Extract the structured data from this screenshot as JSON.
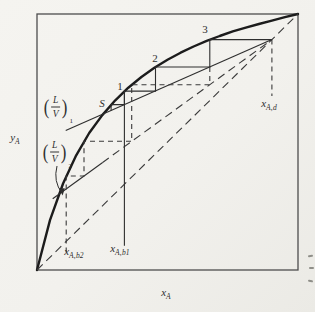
{
  "page": {
    "edge_artifacts": [
      {
        "x": 308,
        "y": 255
      },
      {
        "x": 309,
        "y": 267
      },
      {
        "x": 308,
        "y": 280
      }
    ]
  },
  "figure": {
    "labels": [
      {
        "name": "stage-label-3",
        "kind": "plain",
        "text": "3",
        "x": 205,
        "y": 29
      },
      {
        "name": "stage-label-2",
        "kind": "plain",
        "text": "2",
        "x": 155,
        "y": 58
      },
      {
        "name": "stage-label-1",
        "kind": "plain",
        "text": "1",
        "x": 120,
        "y": 86
      },
      {
        "name": "stage-label-S",
        "kind": "plain",
        "text": "S",
        "x": 102,
        "y": 103,
        "italic": true
      },
      {
        "name": "label-x-Ad",
        "kind": "sub",
        "base": "x",
        "sub": "A,d",
        "x": 269,
        "y": 105
      },
      {
        "name": "label-x-Ab1",
        "kind": "sub",
        "base": "x",
        "sub": "A,b1",
        "x": 120,
        "y": 250
      },
      {
        "name": "label-x-Ab2",
        "kind": "sub",
        "base": "x",
        "sub": "A,b2",
        "x": 74,
        "y": 253
      },
      {
        "name": "axis-label-y",
        "kind": "sub",
        "base": "y",
        "sub": "A",
        "x": 15,
        "y": 139
      },
      {
        "name": "axis-label-x",
        "kind": "sub",
        "base": "x",
        "sub": "A",
        "x": 166,
        "y": 294
      },
      {
        "name": "label-LV1",
        "kind": "fraction",
        "num": "L",
        "den": "V",
        "sub": "1",
        "x": 58,
        "y": 107
      },
      {
        "name": "label-LV2",
        "kind": "fraction",
        "num": "L",
        "den": "V",
        "sub": "2",
        "x": 57,
        "y": 152
      }
    ]
  },
  "chart_data": {
    "type": "line",
    "title": "",
    "xlabel": "x_A",
    "ylabel": "y_A",
    "xlim": [
      0,
      1
    ],
    "ylim": [
      0,
      1
    ],
    "grid": false,
    "description_visible_elements": "equilibrium curve, 45-degree dashed diagonal, operating lines (L/V)1 and (L/V)2 converging at (x_Ad, x_Ad), solid staircase stages S,1,2,3, dashed staircase, composition lines x_Ab2, x_Ab1, x_Ad",
    "key_compositions": {
      "x_Ad": 0.9,
      "x_Ab1": 0.335,
      "x_Ab2": 0.112
    },
    "operating_line_slopes": {
      "LV1": 0.45,
      "LV2": 0.74
    },
    "polylines": [
      {
        "name": "equilibrium-curve",
        "style": "curve",
        "points": [
          [
            0,
            0
          ],
          [
            0.05,
            0.195
          ],
          [
            0.1,
            0.338
          ],
          [
            0.15,
            0.448
          ],
          [
            0.2,
            0.535
          ],
          [
            0.25,
            0.605
          ],
          [
            0.3,
            0.663
          ],
          [
            0.35,
            0.712
          ],
          [
            0.4,
            0.754
          ],
          [
            0.45,
            0.79
          ],
          [
            0.5,
            0.821
          ],
          [
            0.55,
            0.849
          ],
          [
            0.6,
            0.873
          ],
          [
            0.65,
            0.895
          ],
          [
            0.7,
            0.914
          ],
          [
            0.75,
            0.932
          ],
          [
            0.8,
            0.947
          ],
          [
            0.85,
            0.961
          ],
          [
            0.9,
            0.974
          ],
          [
            0.95,
            0.988
          ],
          [
            1,
            1
          ]
        ]
      },
      {
        "name": "diagonal-45",
        "style": "dash-long",
        "points": [
          [
            0,
            0
          ],
          [
            1,
            1
          ]
        ]
      },
      {
        "name": "operating-line-1",
        "style": "thin",
        "points": [
          [
            0.11,
            0.5445
          ],
          [
            0.9,
            0.9
          ]
        ]
      },
      {
        "name": "operating-line-2-solid",
        "style": "thin",
        "points": [
          [
            0.06,
            0.2784
          ],
          [
            0.25,
            0.419
          ]
        ]
      },
      {
        "name": "operating-line-2-dashed",
        "style": "dash-long",
        "points": [
          [
            0.25,
            0.419
          ],
          [
            0.9,
            0.9
          ]
        ]
      },
      {
        "name": "staircase-1-solid",
        "style": "thin",
        "points": [
          [
            0.9,
            0.9
          ],
          [
            0.662,
            0.9
          ],
          [
            0.662,
            0.793
          ],
          [
            0.454,
            0.793
          ],
          [
            0.454,
            0.699
          ],
          [
            0.335,
            0.699
          ],
          [
            0.335,
            0.646
          ],
          [
            0.284,
            0.646
          ],
          [
            0.284,
            0.623
          ]
        ]
      },
      {
        "name": "xab1-drop-line",
        "style": "thin",
        "points": [
          [
            0.335,
            0.699
          ],
          [
            0.335,
            0.095
          ]
        ]
      },
      {
        "name": "staircase-2-dashed",
        "style": "dash-short",
        "points": [
          [
            0.662,
            0.793
          ],
          [
            0.662,
            0.724
          ],
          [
            0.363,
            0.724
          ],
          [
            0.363,
            0.503
          ],
          [
            0.18,
            0.503
          ],
          [
            0.18,
            0.367
          ],
          [
            0.112,
            0.367
          ],
          [
            0.112,
            0.06
          ]
        ]
      },
      {
        "name": "xad-drop-line",
        "style": "dash-short",
        "points": [
          [
            0.9,
            0.9
          ],
          [
            0.9,
            0.68
          ]
        ]
      }
    ],
    "annotation_arrow": {
      "name": "lv2-arrow",
      "from": [
        57,
        166
      ],
      "to": [
        62,
        193
      ]
    }
  }
}
